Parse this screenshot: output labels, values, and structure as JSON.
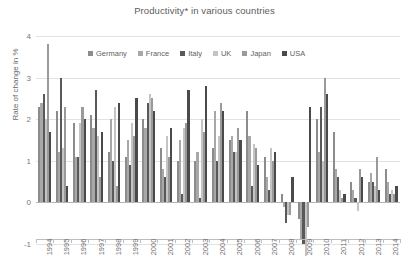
{
  "chart_data": {
    "type": "bar",
    "title": "Productivity* in various countries",
    "xlabel": "",
    "ylabel": "Rate of change in %",
    "ylim": [
      -1,
      4
    ],
    "yticks": [
      "4",
      "3",
      "2",
      "1",
      "0",
      "-1"
    ],
    "grid": true,
    "legend_position": "top-inside",
    "categories": [
      "1994",
      "1995",
      "1996",
      "1997",
      "1998",
      "1999",
      "2000",
      "2001",
      "2002",
      "2003",
      "2004",
      "2005",
      "2006",
      "2007",
      "2008",
      "2009",
      "2010",
      "2011",
      "2012",
      "2013",
      "2014"
    ],
    "series": [
      {
        "name": "Germany",
        "color": "#8c8c8c",
        "values": [
          2.3,
          2.2,
          1.9,
          2.1,
          1.2,
          1.1,
          2.0,
          1.3,
          1.0,
          1.0,
          1.3,
          1.5,
          2.2,
          1.1,
          0.2,
          -0.4,
          2.0,
          1.7,
          0.5,
          0.5,
          0.8
        ]
      },
      {
        "name": "France",
        "color": "#a8a8a8",
        "values": [
          2.4,
          1.2,
          1.1,
          1.8,
          2.0,
          1.5,
          1.8,
          0.8,
          1.5,
          1.2,
          2.2,
          1.6,
          1.6,
          0.6,
          -0.1,
          -0.9,
          1.2,
          0.8,
          0.3,
          0.7,
          0.5
        ]
      },
      {
        "name": "Italy",
        "color": "#595959",
        "values": [
          2.6,
          3.0,
          1.1,
          2.7,
          1.0,
          0.9,
          2.4,
          0.6,
          0.2,
          0.1,
          1.0,
          1.2,
          0.4,
          0.3,
          -0.5,
          -1.0,
          2.3,
          0.6,
          0.1,
          0.5,
          0.2
        ]
      },
      {
        "name": "UK",
        "color": "#c4c4c4",
        "values": [
          2.0,
          1.3,
          1.9,
          1.6,
          2.3,
          1.9,
          2.6,
          1.6,
          1.8,
          2.0,
          1.6,
          1.2,
          1.4,
          1.3,
          -0.3,
          -1.3,
          1.0,
          0.3,
          -0.2,
          0.4,
          0.3
        ]
      },
      {
        "name": "Japan",
        "color": "#9a9a9a",
        "values": [
          3.8,
          2.3,
          2.3,
          0.6,
          0.4,
          1.6,
          2.5,
          1.1,
          1.9,
          1.7,
          2.4,
          1.8,
          1.3,
          1.0,
          -0.3,
          -0.6,
          3.0,
          0.1,
          0.8,
          1.1,
          0.2
        ]
      },
      {
        "name": "USA",
        "color": "#4a4a4a",
        "values": [
          1.7,
          0.4,
          2.0,
          1.7,
          2.4,
          2.5,
          2.2,
          1.8,
          2.7,
          2.8,
          2.2,
          1.5,
          0.9,
          1.2,
          0.6,
          2.3,
          2.6,
          0.2,
          0.6,
          0.3,
          0.4
        ]
      }
    ]
  },
  "legend": {
    "items": [
      {
        "label": "Germany"
      },
      {
        "label": "France"
      },
      {
        "label": "Italy"
      },
      {
        "label": "UK"
      },
      {
        "label": "Japan"
      },
      {
        "label": "USA"
      }
    ]
  }
}
